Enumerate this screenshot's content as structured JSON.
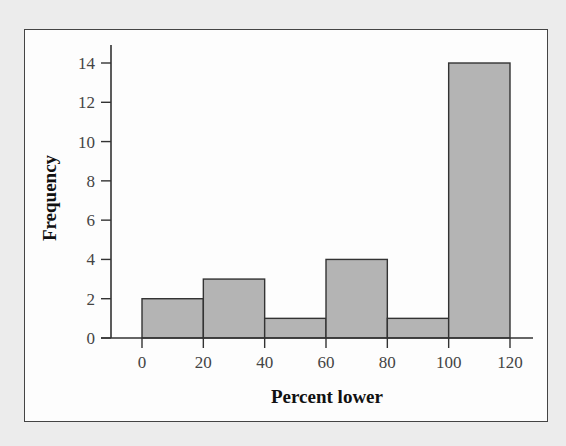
{
  "chart_data": {
    "type": "bar",
    "subtype": "histogram",
    "title": "",
    "xlabel": "Percent lower",
    "ylabel": "Frequency",
    "bin_edges": [
      0,
      20,
      40,
      60,
      80,
      100,
      120
    ],
    "categories": [
      "0-20",
      "20-40",
      "40-60",
      "60-80",
      "80-100",
      "100-120"
    ],
    "values": [
      2,
      3,
      1,
      4,
      1,
      14
    ],
    "x_ticks": [
      "0",
      "20",
      "40",
      "60",
      "80",
      "100",
      "120"
    ],
    "y_ticks": [
      "0",
      "2",
      "4",
      "6",
      "8",
      "10",
      "12",
      "14"
    ],
    "xlim": [
      -15,
      135
    ],
    "ylim": [
      0,
      14.8
    ],
    "grid": false,
    "legend": null,
    "colors": {
      "bar_fill": "#b4b4b4",
      "bar_edge": "#333333",
      "axis": "#333333",
      "frame": "#444444",
      "background": "#ececec",
      "panel": "#fdfdfd"
    }
  }
}
